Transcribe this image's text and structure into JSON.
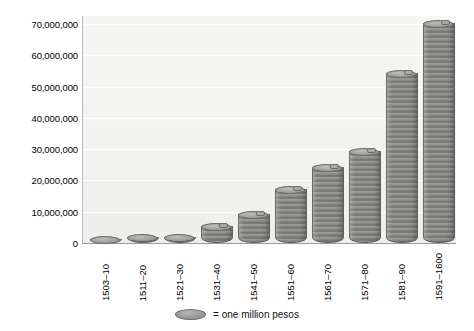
{
  "chart_data": {
    "type": "bar",
    "title": "",
    "subtitle": "",
    "xlabel": "",
    "ylabel": "",
    "categories": [
      "1503–10",
      "1511–20",
      "1521–30",
      "1531–40",
      "1541–50",
      "1551–60",
      "1561–70",
      "1571–80",
      "1581–90",
      "1591–1600"
    ],
    "values": [
      1000000,
      1500000,
      1500000,
      5000000,
      9000000,
      17000000,
      24000000,
      29000000,
      54000000,
      70000000
    ],
    "ylim": [
      0,
      70000000
    ],
    "ytick_values": [
      0,
      10000000,
      20000000,
      30000000,
      40000000,
      50000000,
      60000000,
      70000000
    ],
    "ytick_labels": [
      "0",
      "10,000,000",
      "20,000,000",
      "30,000,000",
      "40,000,000",
      "50,000,000",
      "60,000,000",
      "70,000,000"
    ],
    "grid": true,
    "legend_position": "bottom-center",
    "legend": [
      {
        "marker": "coin-disc",
        "text": "= one million pesos"
      }
    ],
    "unit_note": "each disc represents one million pesos",
    "bar_style": "stacked-coin-discs",
    "colors": {
      "bar_fill": "#8e8e8c",
      "bar_edge": "#6a6a68",
      "plot_background": "#f2f2f0",
      "gridline": "#ffffff",
      "axis": "#9a9a98",
      "text": "#000000",
      "page_background": "#ffffff"
    }
  },
  "legend": {
    "swatch_name": "coin-disc",
    "text": "= one million pesos"
  }
}
